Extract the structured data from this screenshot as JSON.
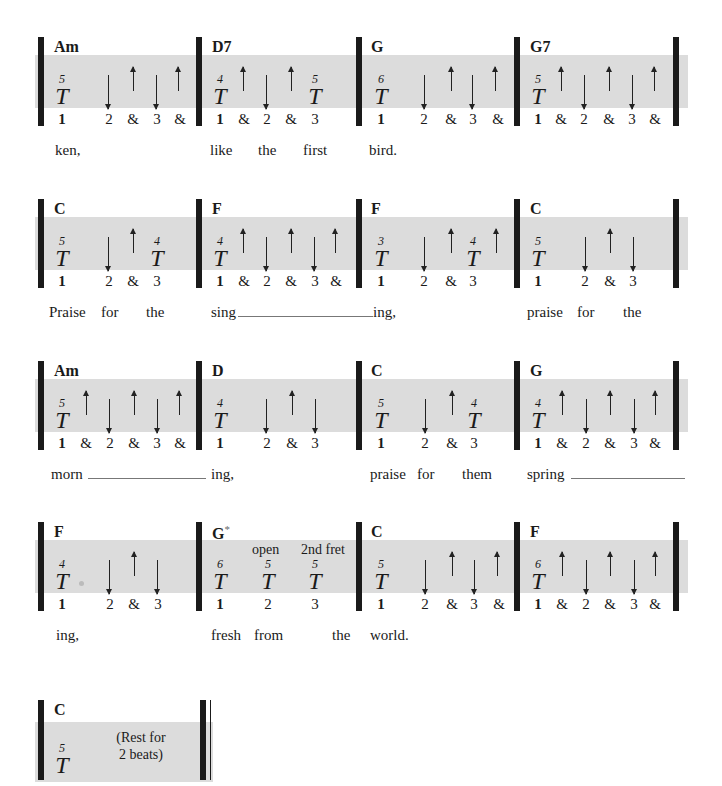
{
  "page": {
    "type": "strumming-pattern-chart",
    "thumb_symbol": "T"
  },
  "rows": [
    {
      "measures": [
        {
          "chord": "Am",
          "beats": [
            "1",
            "2",
            "&",
            "3",
            "&"
          ],
          "thumb": [
            {
              "beat": "1",
              "string": "5"
            }
          ],
          "strums": [
            {
              "beat": "2",
              "dir": "down"
            },
            {
              "beat": "&2",
              "dir": "up"
            },
            {
              "beat": "3",
              "dir": "down"
            },
            {
              "beat": "&3",
              "dir": "up"
            }
          ],
          "lyrics": [
            "ken,"
          ]
        },
        {
          "chord": "D7",
          "beats": [
            "1",
            "&",
            "2",
            "&",
            "3"
          ],
          "thumb": [
            {
              "beat": "1",
              "string": "4"
            },
            {
              "beat": "3",
              "string": "5"
            }
          ],
          "strums": [
            {
              "beat": "&1",
              "dir": "up"
            },
            {
              "beat": "2",
              "dir": "down"
            },
            {
              "beat": "&2",
              "dir": "up"
            }
          ],
          "lyrics": [
            "like",
            "the",
            "first"
          ]
        },
        {
          "chord": "G",
          "beats": [
            "1",
            "2",
            "&",
            "3",
            "&"
          ],
          "thumb": [
            {
              "beat": "1",
              "string": "6"
            }
          ],
          "strums": [
            {
              "beat": "2",
              "dir": "down"
            },
            {
              "beat": "&2",
              "dir": "up"
            },
            {
              "beat": "3",
              "dir": "down"
            },
            {
              "beat": "&3",
              "dir": "up"
            }
          ],
          "lyrics": [
            "bird."
          ]
        },
        {
          "chord": "G7",
          "beats": [
            "1",
            "&",
            "2",
            "&",
            "3",
            "&"
          ],
          "thumb": [
            {
              "beat": "1",
              "string": "5"
            }
          ],
          "strums": [
            {
              "beat": "&1",
              "dir": "up"
            },
            {
              "beat": "2",
              "dir": "down"
            },
            {
              "beat": "&2",
              "dir": "up"
            },
            {
              "beat": "3",
              "dir": "down"
            },
            {
              "beat": "&3",
              "dir": "up"
            }
          ],
          "lyrics": []
        }
      ]
    },
    {
      "measures": [
        {
          "chord": "C",
          "beats": [
            "1",
            "2",
            "&",
            "3"
          ],
          "thumb": [
            {
              "beat": "1",
              "string": "5"
            },
            {
              "beat": "3",
              "string": "4"
            }
          ],
          "strums": [
            {
              "beat": "2",
              "dir": "down"
            },
            {
              "beat": "&2",
              "dir": "up"
            }
          ],
          "lyrics": [
            "Praise",
            "for",
            "the"
          ]
        },
        {
          "chord": "F",
          "beats": [
            "1",
            "&",
            "2",
            "&",
            "3",
            "&"
          ],
          "thumb": [
            {
              "beat": "1",
              "string": "4"
            }
          ],
          "strums": [
            {
              "beat": "&1",
              "dir": "up"
            },
            {
              "beat": "2",
              "dir": "down"
            },
            {
              "beat": "&2",
              "dir": "up"
            },
            {
              "beat": "3",
              "dir": "down"
            },
            {
              "beat": "&3",
              "dir": "up"
            }
          ],
          "lyrics": [
            "sing"
          ]
        },
        {
          "chord": "F",
          "beats": [
            "1",
            "2",
            "&",
            "3"
          ],
          "thumb": [
            {
              "beat": "1",
              "string": "3"
            },
            {
              "beat": "3",
              "string": "4"
            }
          ],
          "strums": [
            {
              "beat": "2",
              "dir": "down"
            },
            {
              "beat": "&2",
              "dir": "up"
            },
            {
              "beat": "&3",
              "dir": "up"
            }
          ],
          "lyrics": [
            "ing,"
          ]
        },
        {
          "chord": "C",
          "beats": [
            "1",
            "2",
            "&",
            "3"
          ],
          "thumb": [
            {
              "beat": "1",
              "string": "5"
            }
          ],
          "strums": [
            {
              "beat": "2",
              "dir": "down"
            },
            {
              "beat": "&2",
              "dir": "up"
            },
            {
              "beat": "3",
              "dir": "down"
            }
          ],
          "lyrics": [
            "praise",
            "for",
            "the"
          ]
        }
      ]
    },
    {
      "measures": [
        {
          "chord": "Am",
          "beats": [
            "1",
            "&",
            "2",
            "&",
            "3",
            "&"
          ],
          "thumb": [
            {
              "beat": "1",
              "string": "5"
            }
          ],
          "strums": [
            {
              "beat": "&1",
              "dir": "up"
            },
            {
              "beat": "2",
              "dir": "down"
            },
            {
              "beat": "&2",
              "dir": "up"
            },
            {
              "beat": "3",
              "dir": "down"
            },
            {
              "beat": "&3",
              "dir": "up"
            }
          ],
          "lyrics": [
            "morn"
          ]
        },
        {
          "chord": "D",
          "beats": [
            "1",
            "2",
            "&",
            "3"
          ],
          "thumb": [
            {
              "beat": "1",
              "string": "4"
            }
          ],
          "strums": [
            {
              "beat": "2",
              "dir": "down"
            },
            {
              "beat": "&2",
              "dir": "up"
            },
            {
              "beat": "3",
              "dir": "down"
            }
          ],
          "lyrics": [
            "ing,"
          ]
        },
        {
          "chord": "C",
          "beats": [
            "1",
            "2",
            "&",
            "3"
          ],
          "thumb": [
            {
              "beat": "1",
              "string": "5"
            },
            {
              "beat": "3",
              "string": "4"
            }
          ],
          "strums": [
            {
              "beat": "2",
              "dir": "down"
            },
            {
              "beat": "&2",
              "dir": "up"
            }
          ],
          "lyrics": [
            "praise",
            "for",
            "them"
          ]
        },
        {
          "chord": "G",
          "beats": [
            "1",
            "&",
            "2",
            "&",
            "3",
            "&"
          ],
          "thumb": [
            {
              "beat": "1",
              "string": "4"
            }
          ],
          "strums": [
            {
              "beat": "&1",
              "dir": "up"
            },
            {
              "beat": "2",
              "dir": "down"
            },
            {
              "beat": "&2",
              "dir": "up"
            },
            {
              "beat": "3",
              "dir": "down"
            },
            {
              "beat": "&3",
              "dir": "up"
            }
          ],
          "lyrics": [
            "spring"
          ]
        }
      ]
    },
    {
      "measures": [
        {
          "chord": "F",
          "beats": [
            "1",
            "2",
            "&",
            "3"
          ],
          "thumb": [
            {
              "beat": "1",
              "string": "4"
            }
          ],
          "strums": [
            {
              "beat": "2",
              "dir": "down"
            },
            {
              "beat": "&2",
              "dir": "up"
            },
            {
              "beat": "3",
              "dir": "down"
            }
          ],
          "lyrics": [
            "ing,"
          ]
        },
        {
          "chord": "G",
          "chord_mark": "*",
          "beats": [
            "1",
            "2",
            "3"
          ],
          "thumb": [
            {
              "beat": "1",
              "string": "6"
            },
            {
              "beat": "2",
              "string": "5"
            },
            {
              "beat": "3",
              "string": "5"
            }
          ],
          "notes": [
            "open",
            "2nd fret"
          ],
          "strums": [],
          "lyrics": [
            "fresh",
            "from",
            "the"
          ]
        },
        {
          "chord": "C",
          "beats": [
            "1",
            "2",
            "&",
            "3",
            "&"
          ],
          "thumb": [
            {
              "beat": "1",
              "string": "5"
            }
          ],
          "strums": [
            {
              "beat": "2",
              "dir": "down"
            },
            {
              "beat": "&2",
              "dir": "up"
            },
            {
              "beat": "3",
              "dir": "down"
            },
            {
              "beat": "&3",
              "dir": "up"
            }
          ],
          "lyrics": [
            "world."
          ]
        },
        {
          "chord": "F",
          "beats": [
            "1",
            "&",
            "2",
            "&",
            "3",
            "&"
          ],
          "thumb": [
            {
              "beat": "1",
              "string": "6"
            }
          ],
          "strums": [
            {
              "beat": "&1",
              "dir": "up"
            },
            {
              "beat": "2",
              "dir": "down"
            },
            {
              "beat": "&2",
              "dir": "up"
            },
            {
              "beat": "3",
              "dir": "down"
            },
            {
              "beat": "&3",
              "dir": "up"
            }
          ],
          "lyrics": []
        }
      ]
    },
    {
      "measures": [
        {
          "chord": "C",
          "thumb": [
            {
              "beat": "1",
              "string": "5"
            }
          ],
          "rest_text": [
            "(Rest for",
            "2 beats)"
          ]
        }
      ]
    }
  ]
}
